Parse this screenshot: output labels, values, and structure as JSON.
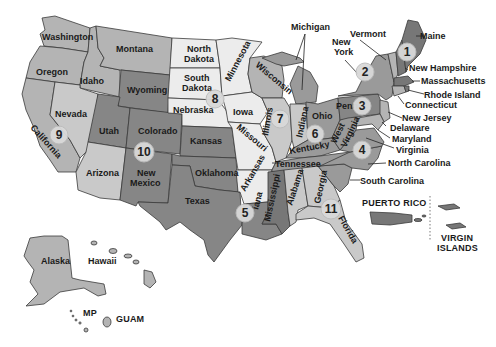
{
  "map": {
    "title": "US Regions Map",
    "colors": {
      "light": "#ececec",
      "light_mid": "#c9c9c9",
      "mid": "#b4b4b4",
      "dark_mid": "#9a9a9a",
      "dark": "#868686",
      "very_dark": "#777777",
      "border": "#3a3a3a",
      "region_marker": "#d9d9d9"
    },
    "states": {
      "washington": "Washington",
      "oregon": "Oregon",
      "california": "California",
      "idaho": "Idaho",
      "nevada": "Nevada",
      "montana": "Montana",
      "wyoming": "Wyoming",
      "utah": "Utah",
      "arizona": "Arizona",
      "colorado": "Colorado",
      "new_mexico_1": "New",
      "new_mexico_2": "Mexico",
      "north_dakota_1": "North",
      "north_dakota_2": "Dakota",
      "south_dakota_1": "South",
      "south_dakota_2": "Dakota",
      "nebraska": "Nebraska",
      "kansas": "Kansas",
      "oklahoma": "Oklahoma",
      "texas": "Texas",
      "minnesota": "Minnesota",
      "iowa": "Iowa",
      "missouri": "Missouri",
      "arkansas": "Arkansas",
      "louisiana": "iana",
      "wisconsin": "Wisconsin",
      "michigan": "Michigan",
      "illinois": "Illinois",
      "indiana": "Indiana",
      "ohio": "Ohio",
      "kentucky": "Kentucky",
      "tennessee": "Tennessee",
      "mississippi": "Mississippi",
      "alabama": "Alabama",
      "georgia": "Georgia",
      "florida": "Florida",
      "south_carolina": "South Carolina",
      "north_carolina": "North Carolina",
      "virginia": "Virginia",
      "west_virginia_1": "West",
      "west_virginia_2": "Virginia",
      "pennsylvania": "Penn",
      "new_york_1": "New",
      "new_york_2": "York",
      "vermont": "Vermont",
      "maine": "Maine",
      "new_hampshire": "New Hampshire",
      "massachusetts": "Massachusetts",
      "rhode_island": "Rhode Island",
      "connecticut": "Connecticut",
      "new_jersey": "New Jersey",
      "delaware": "Delaware",
      "maryland": "Maryland",
      "alaska": "Alaska",
      "hawaii": "Hawaii"
    },
    "territories": {
      "puerto_rico": "PUERTO RICO",
      "virgin_islands_1": "VIRGIN",
      "virgin_islands_2": "ISLANDS",
      "mp": "MP",
      "guam": "GUAM"
    },
    "regions": [
      {
        "id": 1,
        "label": "1"
      },
      {
        "id": 2,
        "label": "2"
      },
      {
        "id": 3,
        "label": "3"
      },
      {
        "id": 4,
        "label": "4"
      },
      {
        "id": 5,
        "label": "5"
      },
      {
        "id": 6,
        "label": "6"
      },
      {
        "id": 7,
        "label": "7"
      },
      {
        "id": 8,
        "label": "8"
      },
      {
        "id": 9,
        "label": "9"
      },
      {
        "id": 10,
        "label": "10"
      },
      {
        "id": 11,
        "label": "11"
      }
    ]
  }
}
